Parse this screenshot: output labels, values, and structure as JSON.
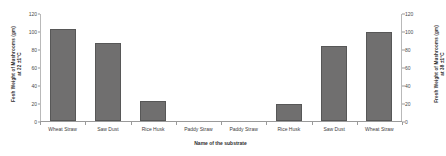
{
  "chart_data": {
    "type": "bar",
    "title": "",
    "xlabel": "Name of the substrate",
    "ylabel_left": "Fesh Weight of Mushrooms (gm)",
    "ylabel_left_sub": "at 22 ±1°C",
    "ylabel_right": "Fresh Weight of Mushrooms (gm)",
    "ylabel_right_sub": "at 38 ±1°C",
    "categories": [
      "Wheat Straw",
      "Saw Dust",
      "Rice Husk",
      "Paddy Straw",
      "Paddy Straw",
      "Rice Husk",
      "Saw Dust",
      "Wheat Straw"
    ],
    "values": [
      103,
      88,
      22,
      0,
      0,
      19,
      84,
      100
    ],
    "ylim": [
      0,
      120
    ],
    "yticks": [
      0,
      20,
      40,
      60,
      80,
      100,
      120
    ],
    "ytick_labels": [
      "0",
      "20",
      "40",
      "60",
      "80",
      "100",
      "120"
    ],
    "ylim_right": [
      0,
      120
    ],
    "yticks_right": [
      0,
      20,
      40,
      60,
      80,
      100,
      120
    ],
    "ytick_labels_right": [
      "0",
      "20",
      "40",
      "60",
      "80",
      "100",
      "120"
    ],
    "grid": false,
    "legend": false,
    "bar_color": "#706f6f",
    "axis_color": "#9a9a9a"
  }
}
